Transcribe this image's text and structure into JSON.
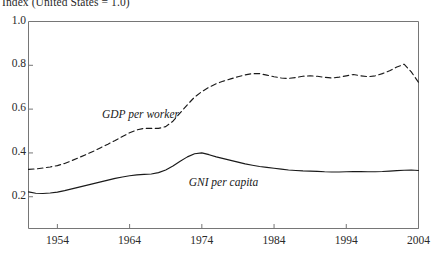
{
  "chart_data": {
    "type": "line",
    "title": "Index (United States = 1.0)",
    "xlabel": "",
    "ylabel": "Index (United States = 1.0)",
    "xlim": [
      1950,
      2004
    ],
    "ylim": [
      0.055,
      1.0
    ],
    "grid": false,
    "legend_position": "inline-annotations",
    "y_ticks": [
      "1.0",
      "0.8",
      "0.6",
      "0.4",
      "0.2"
    ],
    "y_tick_values": [
      1.0,
      0.8,
      0.6,
      0.4,
      0.2
    ],
    "x_ticks": [
      "1954",
      "1964",
      "1974",
      "1984",
      "1994",
      "2004"
    ],
    "x_tick_values": [
      1954,
      1964,
      1974,
      1984,
      1994,
      2004
    ],
    "series": [
      {
        "name": "GDP per worker",
        "style": "dashed",
        "color": "#1a1a1a",
        "x": [
          1950,
          1951,
          1952,
          1953,
          1954,
          1955,
          1956,
          1957,
          1958,
          1959,
          1960,
          1961,
          1962,
          1963,
          1964,
          1965,
          1966,
          1967,
          1968,
          1969,
          1970,
          1971,
          1972,
          1973,
          1974,
          1975,
          1976,
          1977,
          1978,
          1979,
          1980,
          1981,
          1982,
          1983,
          1984,
          1985,
          1986,
          1987,
          1988,
          1989,
          1990,
          1991,
          1992,
          1993,
          1994,
          1995,
          1996,
          1997,
          1998,
          1999,
          2000,
          2001,
          2002,
          2003,
          2004
        ],
        "values": [
          0.325,
          0.327,
          0.331,
          0.336,
          0.342,
          0.352,
          0.365,
          0.379,
          0.393,
          0.408,
          0.424,
          0.44,
          0.457,
          0.475,
          0.492,
          0.505,
          0.512,
          0.512,
          0.512,
          0.52,
          0.545,
          0.583,
          0.62,
          0.655,
          0.68,
          0.7,
          0.716,
          0.728,
          0.738,
          0.748,
          0.756,
          0.762,
          0.762,
          0.755,
          0.748,
          0.742,
          0.74,
          0.744,
          0.75,
          0.752,
          0.75,
          0.745,
          0.742,
          0.746,
          0.752,
          0.758,
          0.752,
          0.748,
          0.752,
          0.762,
          0.775,
          0.792,
          0.805,
          0.77,
          0.722
        ]
      },
      {
        "name": "GNI per capita",
        "style": "solid",
        "color": "#1a1a1a",
        "x": [
          1950,
          1951,
          1952,
          1953,
          1954,
          1955,
          1956,
          1957,
          1958,
          1959,
          1960,
          1961,
          1962,
          1963,
          1964,
          1965,
          1966,
          1967,
          1968,
          1969,
          1970,
          1971,
          1972,
          1973,
          1974,
          1975,
          1976,
          1977,
          1978,
          1979,
          1980,
          1981,
          1982,
          1983,
          1984,
          1985,
          1986,
          1987,
          1988,
          1989,
          1990,
          1991,
          1992,
          1993,
          1994,
          1995,
          1996,
          1997,
          1998,
          1999,
          2000,
          2001,
          2002,
          2003,
          2004
        ],
        "values": [
          0.222,
          0.216,
          0.215,
          0.217,
          0.221,
          0.228,
          0.236,
          0.244,
          0.252,
          0.26,
          0.268,
          0.276,
          0.284,
          0.29,
          0.296,
          0.3,
          0.302,
          0.304,
          0.31,
          0.322,
          0.34,
          0.362,
          0.382,
          0.396,
          0.4,
          0.392,
          0.382,
          0.374,
          0.366,
          0.358,
          0.35,
          0.344,
          0.338,
          0.334,
          0.33,
          0.326,
          0.322,
          0.32,
          0.318,
          0.317,
          0.316,
          0.314,
          0.313,
          0.313,
          0.314,
          0.315,
          0.315,
          0.314,
          0.314,
          0.315,
          0.317,
          0.319,
          0.321,
          0.322,
          0.32
        ]
      }
    ],
    "annotations": [
      {
        "text": "GDP per worker",
        "x": 1965.5,
        "y": 0.575
      },
      {
        "text": "GNI per capita",
        "x": 1977.0,
        "y": 0.265
      }
    ]
  }
}
